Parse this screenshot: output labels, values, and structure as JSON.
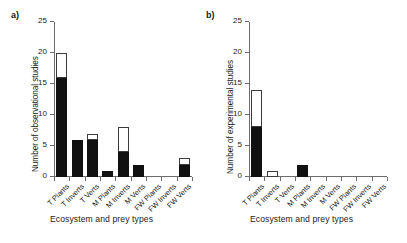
{
  "figure": {
    "width": 407,
    "height": 243,
    "background": "#ffffff",
    "bar_fill_dark": "#111111",
    "bar_fill_light": "#ffffff",
    "bar_outline": "#3b3b3b",
    "axis_color": "#6d6d6d"
  },
  "panels": [
    {
      "label": "a)",
      "ylabel": "Number of observational studies",
      "xlabel": "Ecosystem and prey types"
    },
    {
      "label": "b)",
      "ylabel": "Number of experimental studies",
      "xlabel": "Ecosystem and prey types"
    }
  ],
  "yticks": [
    "0",
    "5",
    "10",
    "15",
    "20",
    "25"
  ],
  "chart_data": [
    {
      "type": "bar",
      "title": "a)",
      "xlabel": "Ecosystem and prey types",
      "ylabel": "Number of observational studies",
      "ylim": [
        0,
        25
      ],
      "yticks": [
        0,
        5,
        10,
        15,
        20,
        25
      ],
      "grid": false,
      "legend": "none",
      "stacked": true,
      "categories": [
        "T Plants",
        "T Inverts",
        "T Verts",
        "M Plants",
        "M Inverts",
        "M Verts",
        "FW Plants",
        "FW Inverts",
        "FW Verts"
      ],
      "series": [
        {
          "name": "black",
          "values": [
            16,
            6,
            6,
            1,
            4,
            2,
            0,
            0,
            2
          ]
        },
        {
          "name": "white",
          "values": [
            4,
            0,
            1,
            0,
            4,
            0,
            0,
            0,
            1
          ]
        }
      ],
      "totals": [
        20,
        6,
        7,
        1,
        8,
        2,
        0,
        0,
        3
      ]
    },
    {
      "type": "bar",
      "title": "b)",
      "xlabel": "Ecosystem and prey types",
      "ylabel": "Number of experimental studies",
      "ylim": [
        0,
        25
      ],
      "yticks": [
        0,
        5,
        10,
        15,
        20,
        25
      ],
      "grid": false,
      "legend": "none",
      "stacked": true,
      "categories": [
        "T Plants",
        "T Inverts",
        "T Verts",
        "M Plants",
        "M Inverts",
        "M Verts",
        "FW Plants",
        "FW Inverts",
        "FW Verts"
      ],
      "series": [
        {
          "name": "black",
          "values": [
            8,
            0,
            0,
            2,
            0,
            0,
            0,
            0,
            0
          ]
        },
        {
          "name": "white",
          "values": [
            6,
            1,
            0,
            0,
            0,
            0,
            0,
            0,
            0
          ]
        }
      ],
      "totals": [
        14,
        1,
        0,
        2,
        0,
        0,
        0,
        0,
        0
      ]
    }
  ]
}
